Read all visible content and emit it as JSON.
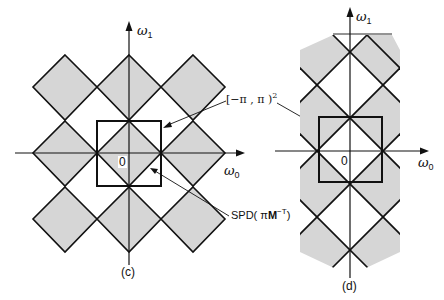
{
  "figure": {
    "panels": [
      {
        "id": "c",
        "caption": "(c)",
        "x_axis_label": "ω",
        "x_axis_sub": "0",
        "y_axis_label": "ω",
        "y_axis_sub": "1",
        "origin_label": "0",
        "fill_color": "#d6d6d6",
        "line_color": "#111111"
      },
      {
        "id": "d",
        "caption": "(d)",
        "x_axis_label": "ω",
        "x_axis_sub": "0",
        "y_axis_label": "ω",
        "y_axis_sub": "1",
        "origin_label": "0",
        "fill_color": "#d6d6d6",
        "line_color": "#111111"
      }
    ],
    "annotations": {
      "square_region": {
        "text": "[−π , π )",
        "sup": "2"
      },
      "spd": {
        "prefix": "SPD( π",
        "bold": "M",
        "sup": "−T",
        "suffix": ")"
      }
    }
  }
}
